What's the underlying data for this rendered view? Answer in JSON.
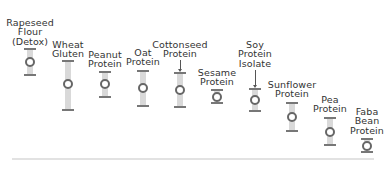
{
  "chart_data": {
    "type": "scatter",
    "subtype": "range-with-point",
    "title": "",
    "xlabel": "",
    "ylabel": "",
    "grid": false,
    "legend": null,
    "y_axis_inverted_pixels": true,
    "categories": [
      "Rapeseed Flour (Detox)",
      "Wheat Gluten",
      "Peanut Protein",
      "Oat Protein",
      "Cottonseed Protein",
      "Sesame Protein",
      "Soy Protein Isolate",
      "Sunflower Protein",
      "Pea Protein",
      "Faba Bean Protein"
    ],
    "series": [
      {
        "name": "point (pixel y)",
        "values": [
          62,
          84,
          84,
          88,
          90,
          97,
          100,
          117,
          132,
          146
        ]
      },
      {
        "name": "range top (pixel y)",
        "values": [
          49,
          61,
          72,
          71,
          73,
          90,
          89,
          103,
          118,
          139
        ]
      },
      {
        "name": "range bottom (pixel y)",
        "values": [
          75,
          110,
          97,
          106,
          107,
          103,
          111,
          131,
          145,
          152
        ]
      }
    ],
    "annotations": [
      "arrow pointing to Cottonseed Protein range",
      "arrow pointing to Soy Protein Isolate range"
    ]
  },
  "items": [
    {
      "label": "Rapeseed\nFlour\n(Detox)",
      "x": 30,
      "labelTop": 18,
      "top": 49,
      "mid": 62,
      "bottom": 75,
      "arrow": false
    },
    {
      "label": "Wheat\nGluten",
      "x": 68,
      "labelTop": 40,
      "top": 61,
      "mid": 84,
      "bottom": 110,
      "arrow": false
    },
    {
      "label": "Peanut\nProtein",
      "x": 105,
      "labelTop": 50,
      "top": 72,
      "mid": 84,
      "bottom": 97,
      "arrow": false
    },
    {
      "label": "Oat\nProtein",
      "x": 143,
      "labelTop": 48,
      "top": 71,
      "mid": 88,
      "bottom": 106,
      "arrow": false
    },
    {
      "label": "Cottonseed\nProtein",
      "x": 180,
      "labelTop": 40,
      "top": 73,
      "mid": 90,
      "bottom": 107,
      "arrow": true,
      "arrowTop": 60
    },
    {
      "label": "Sesame\nProtein",
      "x": 217,
      "labelTop": 68,
      "top": 90,
      "mid": 97,
      "bottom": 103,
      "arrow": false
    },
    {
      "label": "Soy\nProtein\nIsolate",
      "x": 255,
      "labelTop": 40,
      "top": 89,
      "mid": 100,
      "bottom": 111,
      "arrow": true,
      "arrowTop": 70
    },
    {
      "label": "Sunflower\nProtein",
      "x": 292,
      "labelTop": 80,
      "top": 103,
      "mid": 117,
      "bottom": 131,
      "arrow": false
    },
    {
      "label": "Pea\nProtein",
      "x": 330,
      "labelTop": 95,
      "top": 118,
      "mid": 132,
      "bottom": 145,
      "arrow": false
    },
    {
      "label": "Faba\nBean\nProtein",
      "x": 367,
      "labelTop": 107,
      "top": 139,
      "mid": 146,
      "bottom": 152,
      "arrow": false
    }
  ],
  "colors": {
    "bar": "#d9d9d9",
    "cap": "#777777",
    "point": "#666666",
    "text": "#333333",
    "axis": "#e2e2e2"
  }
}
